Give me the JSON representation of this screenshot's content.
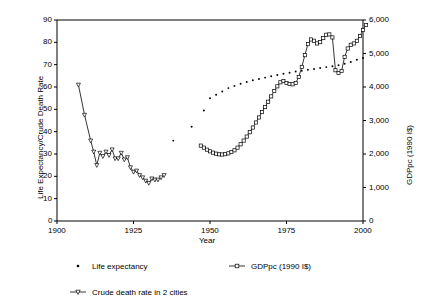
{
  "chart_data": {
    "type": "line",
    "title": "",
    "xlabel": "Year",
    "ylabel_left": "Life Expectancy/Crude Death Rate",
    "ylabel_right": "GDPpc (1990 I$)",
    "xlim": [
      1900,
      2000
    ],
    "xticks": [
      1900,
      1925,
      1950,
      1975,
      2000
    ],
    "xtick_labels": [
      "1900",
      "1925",
      "1950",
      "1975",
      "2000"
    ],
    "ylim_left": [
      0,
      90
    ],
    "yticks_left": [
      0,
      10,
      20,
      30,
      40,
      50,
      60,
      70,
      80,
      90
    ],
    "ytick_labels_left": [
      "0",
      "10",
      "20",
      "30",
      "40",
      "50",
      "60",
      "70",
      "80",
      "90"
    ],
    "ylim_right": [
      0,
      6000
    ],
    "yticks_right": [
      0,
      1000,
      2000,
      3000,
      4000,
      5000,
      6000
    ],
    "ytick_labels_right": [
      "0",
      "1,000",
      "2,000",
      "3,000",
      "4,000",
      "5,000",
      "6,000"
    ],
    "grid": false,
    "legend_position": "below",
    "series": [
      {
        "name": "Life expectancy",
        "axis": "left",
        "marker": "dot",
        "line": false,
        "color": "#000000",
        "points": [
          [
            1938,
            36.0
          ],
          [
            1944,
            42.2
          ],
          [
            1948,
            49.5
          ],
          [
            1950,
            55.0
          ],
          [
            1952,
            56.5
          ],
          [
            1954,
            58.0
          ],
          [
            1956,
            59.5
          ],
          [
            1958,
            60.5
          ],
          [
            1960,
            61.5
          ],
          [
            1962,
            62.2
          ],
          [
            1964,
            63.0
          ],
          [
            1966,
            63.6
          ],
          [
            1968,
            64.2
          ],
          [
            1970,
            64.8
          ],
          [
            1972,
            65.4
          ],
          [
            1974,
            65.9
          ],
          [
            1976,
            66.4
          ],
          [
            1978,
            66.9
          ],
          [
            1980,
            67.3
          ],
          [
            1982,
            67.7
          ],
          [
            1984,
            68.1
          ],
          [
            1986,
            68.5
          ],
          [
            1988,
            68.9
          ],
          [
            1990,
            69.3
          ],
          [
            1992,
            69.7
          ],
          [
            1994,
            70.4
          ],
          [
            1996,
            71.2
          ],
          [
            1998,
            72.2
          ],
          [
            2000,
            73.0
          ]
        ]
      },
      {
        "name": "GDPpc (1990 I$)",
        "axis": "right",
        "marker": "square",
        "line": true,
        "color": "#000000",
        "points": [
          [
            1947,
            2250
          ],
          [
            1948,
            2190
          ],
          [
            1949,
            2130
          ],
          [
            1950,
            2080
          ],
          [
            1951,
            2040
          ],
          [
            1952,
            2010
          ],
          [
            1953,
            1990
          ],
          [
            1954,
            1985
          ],
          [
            1955,
            1995
          ],
          [
            1956,
            2020
          ],
          [
            1957,
            2060
          ],
          [
            1958,
            2110
          ],
          [
            1959,
            2190
          ],
          [
            1960,
            2290
          ],
          [
            1961,
            2400
          ],
          [
            1962,
            2520
          ],
          [
            1963,
            2650
          ],
          [
            1964,
            2790
          ],
          [
            1965,
            2940
          ],
          [
            1966,
            3090
          ],
          [
            1967,
            3250
          ],
          [
            1968,
            3400
          ],
          [
            1969,
            3560
          ],
          [
            1970,
            3720
          ],
          [
            1971,
            3880
          ],
          [
            1972,
            4020
          ],
          [
            1973,
            4140
          ],
          [
            1974,
            4180
          ],
          [
            1975,
            4120
          ],
          [
            1976,
            4090
          ],
          [
            1977,
            4080
          ],
          [
            1978,
            4120
          ],
          [
            1979,
            4300
          ],
          [
            1980,
            4600
          ],
          [
            1981,
            4950
          ],
          [
            1982,
            5280
          ],
          [
            1983,
            5420
          ],
          [
            1984,
            5380
          ],
          [
            1985,
            5300
          ],
          [
            1986,
            5340
          ],
          [
            1987,
            5460
          ],
          [
            1988,
            5560
          ],
          [
            1989,
            5570
          ],
          [
            1990,
            5480
          ],
          [
            1991,
            4500
          ],
          [
            1992,
            4420
          ],
          [
            1993,
            4480
          ],
          [
            1994,
            4900
          ],
          [
            1995,
            5150
          ],
          [
            1996,
            5260
          ],
          [
            1997,
            5300
          ],
          [
            1998,
            5380
          ],
          [
            1999,
            5520
          ],
          [
            2000,
            5700
          ],
          [
            2001,
            5850
          ]
        ]
      },
      {
        "name": "Crude death rate in 2 cities",
        "axis": "left",
        "marker": "triangle-down",
        "line": true,
        "color": "#000000",
        "points": [
          [
            1907,
            61.0
          ],
          [
            1909,
            47.5
          ],
          [
            1911,
            36.0
          ],
          [
            1912,
            31.0
          ],
          [
            1913,
            25.0
          ],
          [
            1914,
            30.5
          ],
          [
            1915,
            29.0
          ],
          [
            1916,
            31.0
          ],
          [
            1917,
            29.5
          ],
          [
            1918,
            32.0
          ],
          [
            1919,
            28.0
          ],
          [
            1920,
            28.0
          ],
          [
            1921,
            30.5
          ],
          [
            1922,
            27.5
          ],
          [
            1923,
            28.5
          ],
          [
            1924,
            24.0
          ],
          [
            1925,
            22.0
          ],
          [
            1926,
            22.5
          ],
          [
            1927,
            20.5
          ],
          [
            1928,
            19.5
          ],
          [
            1929,
            18.0
          ],
          [
            1930,
            17.0
          ],
          [
            1931,
            19.0
          ],
          [
            1932,
            18.5
          ],
          [
            1933,
            18.5
          ],
          [
            1934,
            19.5
          ],
          [
            1935,
            20.5
          ]
        ]
      }
    ]
  },
  "legend": {
    "items": [
      {
        "label": "Life expectancy",
        "marker": "dot"
      },
      {
        "label": "GDPpc (1990 I$)",
        "marker": "square-line"
      },
      {
        "label": "Crude death rate in 2 cities",
        "marker": "triangle-line"
      }
    ]
  }
}
